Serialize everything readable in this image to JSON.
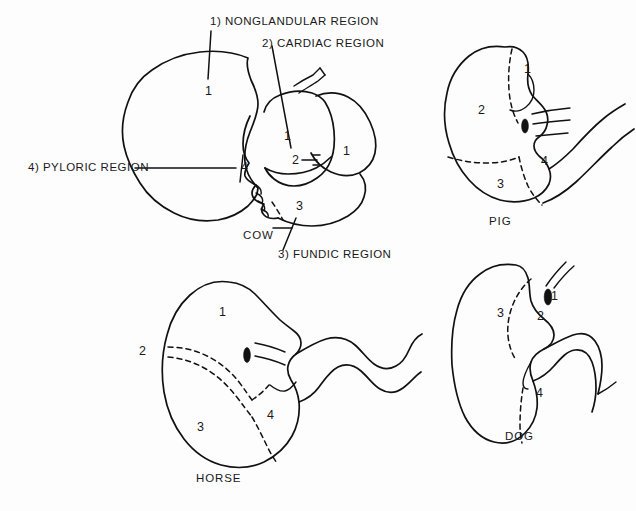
{
  "figure": {
    "background_color": "#fdfdfd",
    "ink_color": "#111111",
    "width": 636,
    "height": 511
  },
  "legend": {
    "items": [
      {
        "key": "1",
        "text": "1)  NONGLANDULAR REGION"
      },
      {
        "key": "2",
        "text": "2)  CARDIAC REGION"
      },
      {
        "key": "3",
        "text": "3)  FUNDIC REGION"
      },
      {
        "key": "4",
        "text": "4)  PYLORIC REGION"
      }
    ]
  },
  "panels": {
    "cow": {
      "species_label": "COW",
      "region_numbers": [
        "1",
        "1",
        "1",
        "2",
        "3",
        "4"
      ]
    },
    "pig": {
      "species_label": "PIG",
      "region_numbers": [
        "1",
        "2",
        "3",
        "4"
      ]
    },
    "horse": {
      "species_label": "HORSE",
      "region_numbers": [
        "1",
        "2",
        "3",
        "4"
      ]
    },
    "dog": {
      "species_label": "DOG",
      "region_numbers": [
        "1",
        "2",
        "3",
        "4"
      ]
    }
  }
}
